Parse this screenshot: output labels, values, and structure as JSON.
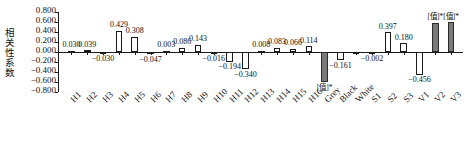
{
  "chart_data": {
    "type": "bar",
    "title": "",
    "xlabel": "",
    "ylabel": "相关性系数",
    "ylim": [
      -0.8,
      0.8
    ],
    "ytick_labels": [
      "0.800",
      "0.600",
      "0.400",
      "0.200",
      "0.000",
      "-0.200",
      "-0.400",
      "-0.600",
      "-0.800"
    ],
    "ytick_values": [
      0.8,
      0.6,
      0.4,
      0.2,
      0.0,
      -0.2,
      -0.4,
      -0.6,
      -0.8
    ],
    "grid": false,
    "legend": "none",
    "categories": [
      "H1",
      "H2",
      "H3",
      "H4",
      "H5",
      "H6",
      "H7",
      "H8",
      "H9",
      "H10",
      "H11",
      "H12",
      "H13",
      "H14",
      "H15",
      "H16",
      "Grey",
      "Black",
      "White",
      "S1",
      "S2",
      "S3",
      "V1",
      "V2",
      "V3"
    ],
    "values": [
      0.03,
      0.039,
      -0.03,
      0.429,
      0.308,
      -0.047,
      0.003,
      0.086,
      0.143,
      -0.016,
      -0.194,
      -0.34,
      0.008,
      0.083,
      0.066,
      0.114,
      -0.605,
      -0.161,
      -0.012,
      -0.002,
      0.397,
      0.18,
      -0.456,
      0.585,
      0.6
    ],
    "value_labels": [
      "0.030",
      "0.039",
      "-0.030",
      "0.429",
      "0.308",
      "-0.047",
      "0.003",
      "0.086",
      "0.143",
      "-0.016",
      "-0.194",
      "-0.340",
      "0.008",
      "0.083",
      "0.066",
      "0.114",
      "[值]*",
      "-0.161",
      "",
      "-0.002",
      "0.397",
      "0.180",
      "-0.456",
      "[值]*",
      "[值]*"
    ],
    "fills": [
      "open",
      "open",
      "open",
      "open",
      "open",
      "open",
      "open",
      "open",
      "open",
      "open",
      "open",
      "open",
      "open",
      "open",
      "open",
      "open",
      "filled",
      "open",
      "open",
      "open",
      "open",
      "open",
      "open",
      "filled",
      "filled"
    ],
    "significant": [
      "",
      "",
      "",
      "",
      "",
      "",
      "",
      "",
      "",
      "",
      "",
      "",
      "",
      "",
      "",
      "",
      "*",
      "",
      "",
      "",
      "",
      "",
      "",
      "*",
      "*"
    ],
    "colors": {
      "open_bar": "#ffffff",
      "filled_bar": "#7a7a7a",
      "axis": "#1a1a1a",
      "text": "#111111"
    }
  }
}
